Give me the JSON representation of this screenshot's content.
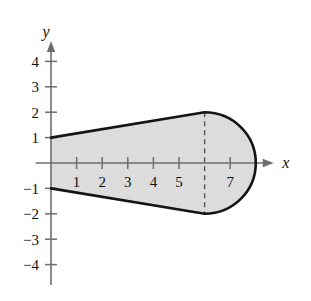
{
  "figure": {
    "name": "shaded-region-plot",
    "axes": {
      "x_label": "x",
      "y_label": "y",
      "x_ticks": [
        {
          "value": 1,
          "label": "1"
        },
        {
          "value": 2,
          "label": "2"
        },
        {
          "value": 3,
          "label": "3"
        },
        {
          "value": 4,
          "label": "4"
        },
        {
          "value": 5,
          "label": "5"
        },
        {
          "value": 6,
          "label": ""
        },
        {
          "value": 7,
          "label": "7"
        }
      ],
      "y_ticks": [
        {
          "value": 4,
          "label": "4"
        },
        {
          "value": 3,
          "label": "3"
        },
        {
          "value": 2,
          "label": "2"
        },
        {
          "value": 1,
          "label": "1"
        },
        {
          "value": -1,
          "label": "−1"
        },
        {
          "value": -2,
          "label": "−2"
        },
        {
          "value": -3,
          "label": "−3"
        },
        {
          "value": -4,
          "label": "−4"
        }
      ],
      "xlim": [
        -0.6,
        8.7
      ],
      "ylim": [
        -4.8,
        4.8
      ],
      "origin_px": [
        51,
        163
      ],
      "unit_px_x": 25.6,
      "unit_px_y": 25.4
    },
    "colors": {
      "fill": "#dcdcdc",
      "edge": "#141414",
      "axis": "#6e6e6e",
      "dashed": "#555555",
      "background": "#ffffff"
    },
    "shape": {
      "description": "Region bounded above and below by straight segments and closed by a semicircular arc",
      "top_line": {
        "from": [
          0,
          1
        ],
        "to": [
          6,
          2
        ]
      },
      "bottom_line": {
        "from": [
          0,
          -1
        ],
        "to": [
          6,
          -2
        ]
      },
      "arc": {
        "center": [
          6,
          0
        ],
        "radius": 2,
        "from": [
          6,
          2
        ],
        "to": [
          6,
          -2
        ],
        "sweep": "right"
      },
      "left_edge": {
        "from": [
          0,
          1
        ],
        "to": [
          0,
          -1
        ]
      },
      "dashed_line": {
        "x": 6,
        "y_from": -2,
        "y_to": 2
      }
    }
  }
}
